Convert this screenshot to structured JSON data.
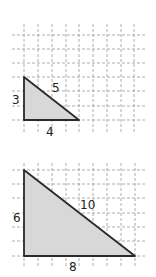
{
  "figures": [
    {
      "name": "small-triangle",
      "legs": {
        "vertical": "3",
        "horizontal": "4"
      },
      "hypotenuse": "5",
      "grid": {
        "x0": 10,
        "y0": 22,
        "cols": 10,
        "rows": 8,
        "spacing": 13.8
      },
      "vertices": [
        [
          24,
          77
        ],
        [
          24,
          120
        ],
        [
          79,
          120
        ]
      ],
      "labels": {
        "vertical": {
          "text": "3",
          "x": 12,
          "y": 104
        },
        "hypotenuse": {
          "text": "5",
          "x": 52,
          "y": 92
        },
        "horizontal": {
          "text": "4",
          "x": 46,
          "y": 136
        }
      }
    },
    {
      "name": "large-triangle",
      "legs": {
        "vertical": "6",
        "horizontal": "8"
      },
      "hypotenuse": "10",
      "grid": {
        "x0": 10,
        "y0": 165,
        "cols": 10,
        "rows": 7,
        "spacing": 13.8
      },
      "vertices": [
        [
          24,
          170
        ],
        [
          24,
          256
        ],
        [
          135,
          256
        ]
      ],
      "labels": {
        "vertical": {
          "text": "6",
          "x": 13,
          "y": 222
        },
        "hypotenuse": {
          "text": "10",
          "x": 80,
          "y": 209
        },
        "horizontal": {
          "text": "8",
          "x": 69,
          "y": 271
        }
      }
    }
  ],
  "colors": {
    "fill": "#d8d8d8",
    "stroke": "#2a2a2a",
    "grid": "#9a9a9a"
  }
}
